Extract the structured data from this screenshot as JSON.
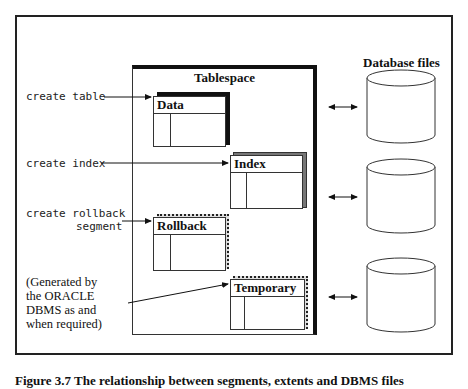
{
  "diagram": {
    "tablespace_label": "Tablespace",
    "database_files_label": "Database files",
    "commands": [
      {
        "text": "create table",
        "target": "Data"
      },
      {
        "text": "create index",
        "target": "Index"
      },
      {
        "text": "create rollback",
        "text2": "segment",
        "target": "Rollback"
      }
    ],
    "note": {
      "lines": [
        "(Generated by",
        "the ORACLE",
        "DBMS as and",
        "when required)"
      ],
      "target": "Temporary"
    },
    "segments": [
      {
        "label": "Data",
        "shadow": "solid-black"
      },
      {
        "label": "Index",
        "shadow": "grey"
      },
      {
        "label": "Rollback",
        "shadow": "dotted"
      },
      {
        "label": "Temporary",
        "shadow": "dotted"
      }
    ],
    "database_files": [
      {
        "name": "file-1"
      },
      {
        "name": "file-2"
      },
      {
        "name": "file-3"
      }
    ],
    "connectors": [
      "bidirectional",
      "bidirectional",
      "bidirectional"
    ],
    "caption": "Figure 3.7 The relationship between segments, extents and DBMS files"
  }
}
